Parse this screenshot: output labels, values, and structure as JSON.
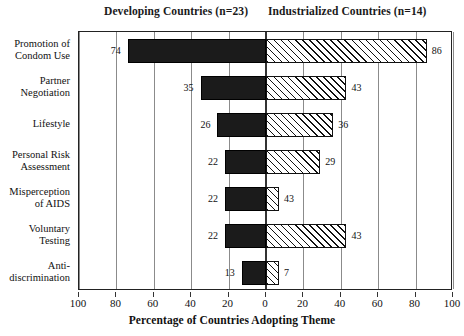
{
  "chart_data": {
    "type": "bar",
    "subtype": "diverging-bar",
    "title": "",
    "xlabel": "Percentage of Countries Adopting Theme",
    "ylabel": "",
    "grid": true,
    "legend_position": "top",
    "axis": {
      "left_range": [
        100,
        0
      ],
      "right_range": [
        0,
        100
      ],
      "tick_step": 20,
      "left_ticks": [
        100,
        80,
        60,
        40,
        20
      ],
      "center_tick": 0,
      "right_ticks": [
        20,
        40,
        60,
        80,
        100
      ],
      "all_tick_labels": [
        "100",
        "80",
        "60",
        "40",
        "20",
        "0",
        "20",
        "40",
        "60",
        "80",
        "100"
      ]
    },
    "categories": [
      "Promotion of\nCondom Use",
      "Partner\nNegotiation",
      "Lifestyle",
      "Personal Risk\nAssessment",
      "Misperception\nof AIDS",
      "Voluntary\nTesting",
      "Anti-\ndiscrimination"
    ],
    "series": [
      {
        "name": "Developing Countries (n=23)",
        "side": "left",
        "fill": "solid-black",
        "color": "#1b1b1b",
        "values": [
          74,
          35,
          26,
          22,
          22,
          22,
          13
        ],
        "labels": [
          "74",
          "35",
          "26",
          "22",
          "22",
          "22",
          "13"
        ]
      },
      {
        "name": "Industrialized Countries (n=14)",
        "side": "right",
        "fill": "diagonal-hatch",
        "color": "#111111",
        "values": [
          86,
          43,
          36,
          29,
          7,
          43,
          7
        ],
        "labels": [
          "86",
          "43",
          "36",
          "29",
          "43",
          "43",
          "7"
        ]
      }
    ]
  },
  "header": {
    "left_group": "Developing Countries (n=23)",
    "right_group": "Industrialized Countries (n=14)"
  }
}
